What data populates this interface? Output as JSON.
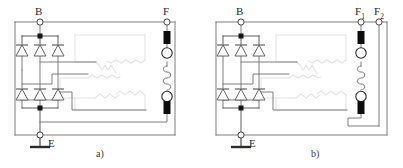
{
  "figure": {
    "type": "circuit-schematic",
    "panels": [
      {
        "id": "a",
        "caption": "a)",
        "terminals": [
          {
            "name": "B",
            "label": "B",
            "subscript": ""
          },
          {
            "name": "F",
            "label": "F",
            "subscript": ""
          },
          {
            "name": "E",
            "label": "E",
            "subscript": ""
          }
        ],
        "components": {
          "diode_count": 6,
          "diode_rows": 2,
          "diodes_per_row": 3,
          "brush_count": 2,
          "slip_ring_count": 2,
          "field_winding_count": 1,
          "stator_winding": "three-phase-star",
          "ground_symbol": true
        }
      },
      {
        "id": "b",
        "caption": "b)",
        "terminals": [
          {
            "name": "B",
            "label": "B",
            "subscript": ""
          },
          {
            "name": "F1",
            "label": "F",
            "subscript": "1"
          },
          {
            "name": "F2",
            "label": "F",
            "subscript": "2"
          },
          {
            "name": "E",
            "label": "E",
            "subscript": ""
          }
        ],
        "components": {
          "diode_count": 6,
          "diode_rows": 2,
          "diodes_per_row": 3,
          "brush_count": 2,
          "slip_ring_count": 2,
          "field_winding_count": 1,
          "stator_winding": "three-phase-star",
          "ground_symbol": true
        }
      }
    ]
  },
  "colors": {
    "wire": "#6f6f6f",
    "wire_dark": "#4a4a4a",
    "diode_outline": "#555555",
    "brush_fill": "#0d0d0d",
    "ring_outline": "#2b2b2b",
    "stator_winding": "#e2e2e2",
    "text": "#2a2a2a",
    "background": "#ffffff"
  }
}
